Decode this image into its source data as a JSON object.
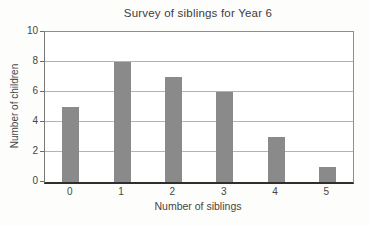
{
  "chart_data": {
    "type": "bar",
    "title": "Survey of siblings for Year 6",
    "xlabel": "Number of siblings",
    "ylabel": "Number of children",
    "categories": [
      "0",
      "1",
      "2",
      "3",
      "4",
      "5"
    ],
    "values": [
      5,
      8,
      7,
      6,
      3,
      1
    ],
    "ylim": [
      0,
      10
    ],
    "yticks": [
      0,
      2,
      4,
      6,
      8,
      10
    ],
    "grid": "horizontal",
    "legend": "none",
    "bar_color": "#8a8a8a",
    "gridline_color": "#b3b3b3",
    "axis_color": "#2e2e2e",
    "border_color": "#8f8f8f",
    "text_color": "#454545"
  }
}
